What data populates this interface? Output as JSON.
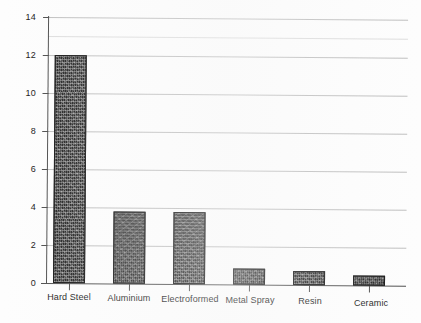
{
  "chart_data": {
    "type": "bar",
    "title": "",
    "subtitle": "",
    "xlabel": "",
    "ylabel": "",
    "categories": [
      "Hard Steel",
      "Aluminium",
      "Electroformed",
      "Metal Spray",
      "Resin",
      "Ceramic"
    ],
    "values": [
      12,
      3.8,
      3.8,
      0.85,
      0.75,
      0.55
    ],
    "series": [
      {
        "name": "",
        "values": [
          12,
          3.8,
          3.8,
          0.85,
          0.75,
          0.55
        ]
      }
    ],
    "ylim": [
      0,
      14
    ],
    "yticks": [
      0,
      2,
      4,
      6,
      8,
      10,
      12,
      14
    ],
    "ytick_labels": [
      "0",
      "2",
      "4",
      "6",
      "8",
      "10",
      "12",
      "14"
    ],
    "grid": true,
    "grid_axis": "y",
    "legend": false,
    "legend_position": "none",
    "bar_color": "#1d1d1d",
    "bar_fill": "dithered-black",
    "axis_color": "#4a4a4a",
    "grid_color": "#b9b9b9",
    "background_color": "#fdfdfd",
    "annotations": []
  },
  "axes": {
    "y_ticks": [
      {
        "label": "14",
        "value": 14
      },
      {
        "label": "12",
        "value": 12
      },
      {
        "label": "10",
        "value": 10
      },
      {
        "label": "8",
        "value": 8
      },
      {
        "label": "6",
        "value": 6
      },
      {
        "label": "4",
        "value": 4
      },
      {
        "label": "2",
        "value": 2
      },
      {
        "label": "0",
        "value": 0
      }
    ],
    "x_categories": [
      {
        "label": "Hard Steel"
      },
      {
        "label": "Aluminium"
      },
      {
        "label": "Electroformed"
      },
      {
        "label": "Metal Spray"
      },
      {
        "label": "Resin"
      },
      {
        "label": "Ceramic"
      }
    ]
  }
}
